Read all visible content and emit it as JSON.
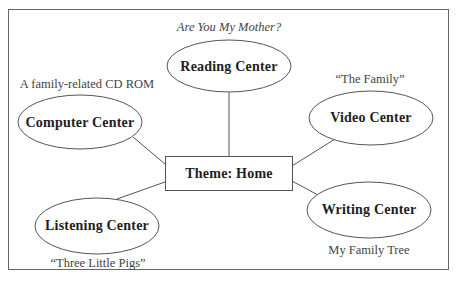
{
  "diagram": {
    "type": "web-diagram",
    "center": {
      "label": "Theme: Home"
    },
    "nodes": [
      {
        "id": "reading",
        "label": "Reading Center",
        "note": "Are You My Mother?",
        "note_style": "italic"
      },
      {
        "id": "computer",
        "label": "Computer Center",
        "note": "A family-related CD ROM",
        "note_style": "normal"
      },
      {
        "id": "video",
        "label": "Video Center",
        "note": "“The Family”",
        "note_style": "normal"
      },
      {
        "id": "listening",
        "label": "Listening Center",
        "note": "“Three Little Pigs”",
        "note_style": "normal"
      },
      {
        "id": "writing",
        "label": "Writing Center",
        "note": "My Family Tree",
        "note_style": "normal"
      }
    ],
    "colors": {
      "stroke": "#555555",
      "text": "#1e1e1e",
      "note": "#444444",
      "background": "#ffffff"
    }
  }
}
